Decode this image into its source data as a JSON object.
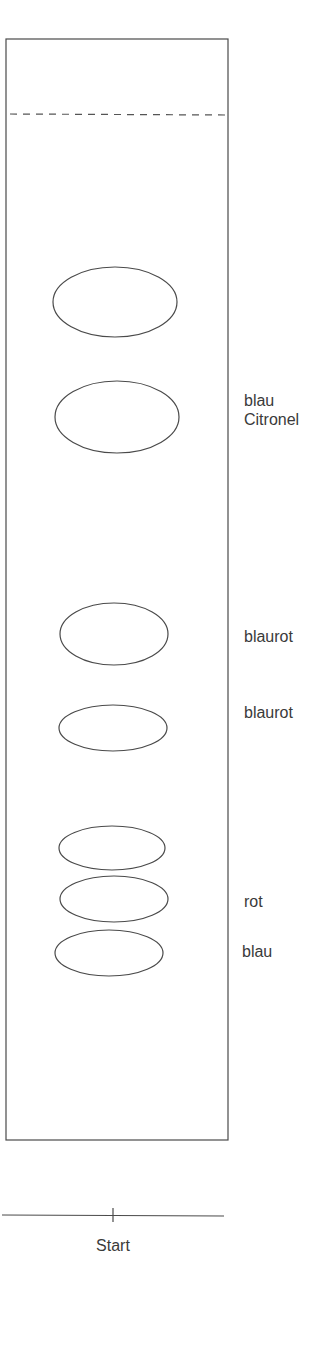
{
  "diagram": {
    "type": "thin-layer-chromatography",
    "plate": {
      "x": 6,
      "y": 39,
      "width": 222,
      "height": 1101,
      "stroke": "#444444"
    },
    "solvent_front": {
      "y": 114,
      "style": "dashed"
    },
    "start_line": {
      "y": 1215,
      "label": "Start",
      "mark_x": 113
    },
    "spots": [
      {
        "cx": 115,
        "cy": 302,
        "rx": 62,
        "ry": 35
      },
      {
        "cx": 117,
        "cy": 417,
        "rx": 62,
        "ry": 36
      },
      {
        "cx": 114,
        "cy": 634,
        "rx": 54,
        "ry": 31
      },
      {
        "cx": 113,
        "cy": 728,
        "rx": 54,
        "ry": 23
      },
      {
        "cx": 112,
        "cy": 848,
        "rx": 53,
        "ry": 22
      },
      {
        "cx": 114,
        "cy": 899,
        "rx": 54,
        "ry": 23
      },
      {
        "cx": 109,
        "cy": 953,
        "rx": 54,
        "ry": 23
      }
    ],
    "labels": [
      {
        "text": "blau\nCitronel",
        "x": 244,
        "y": 391
      },
      {
        "text": "blaurot",
        "x": 244,
        "y": 627
      },
      {
        "text": "blaurot",
        "x": 244,
        "y": 703
      },
      {
        "text": "rot",
        "x": 244,
        "y": 892
      },
      {
        "text": "blau",
        "x": 242,
        "y": 942
      }
    ]
  }
}
